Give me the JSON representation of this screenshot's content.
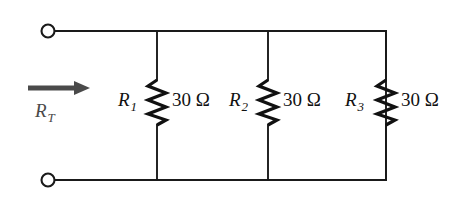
{
  "figure": {
    "background_color": "#ffffff",
    "wire_color": "#1a1a1a",
    "arrow_color": "#4a4a4a"
  },
  "source": {
    "label": "R_T",
    "symbol": "R",
    "subscript": "T",
    "arrow_icon": "right-arrow-icon",
    "terminals": [
      {
        "name": "top-terminal",
        "position": "top-left"
      },
      {
        "name": "bottom-terminal",
        "position": "bottom-left"
      }
    ]
  },
  "resistors": [
    {
      "id": "R1",
      "symbol": "R",
      "subscript": "1",
      "value": "30",
      "unit": "Ω",
      "value_label": "30 Ω"
    },
    {
      "id": "R2",
      "symbol": "R",
      "subscript": "2",
      "value": "30",
      "unit": "Ω",
      "value_label": "30 Ω"
    },
    {
      "id": "R3",
      "symbol": "R",
      "subscript": "3",
      "value": "30",
      "unit": "Ω",
      "value_label": "30 Ω"
    }
  ]
}
